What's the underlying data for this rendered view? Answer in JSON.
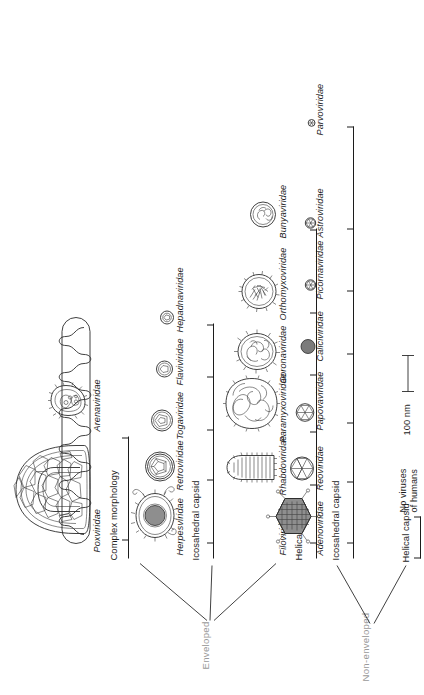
{
  "figure": {
    "scale_bar": {
      "label": "100 nm",
      "length_px": 37
    },
    "branches": {
      "enveloped": {
        "root_label": "Enveloped",
        "groups": [
          {
            "label": "Helical capsid",
            "families": [
              {
                "name": "Filoviridae",
                "shape": "filament"
              },
              {
                "name": "Rhabdoviridae",
                "shape": "bullet"
              },
              {
                "name": "Paramyxoviridae",
                "shape": "pleomorphic-large"
              },
              {
                "name": "Coronaviridae",
                "shape": "spiked-oval"
              },
              {
                "name": "Orthomyxoviridae",
                "shape": "spiked-round"
              },
              {
                "name": "Bunyaviridae",
                "shape": "small-round"
              }
            ]
          },
          {
            "label": "Icosahedral capsid",
            "families": [
              {
                "name": "Herpesviridae",
                "shape": "herpes"
              },
              {
                "name": "Retroviridae",
                "shape": "retro"
              },
              {
                "name": "Togaviridae",
                "shape": "toga"
              },
              {
                "name": "Flaviviridae",
                "shape": "flavi"
              },
              {
                "name": "Hepadnaviridae",
                "shape": "hepadna"
              }
            ]
          },
          {
            "label": "Complex morphology",
            "families": [
              {
                "name": "Poxviridae",
                "shape": "pox"
              },
              {
                "name": "Arenaviridae",
                "shape": "arena"
              }
            ]
          }
        ]
      },
      "non_enveloped": {
        "root_label": "Non-enveloped",
        "groups": [
          {
            "label": "Helical capsid",
            "note": "No viruses\nof humans",
            "note_line1": "No viruses",
            "note_line2": "of humans",
            "families": []
          },
          {
            "label": "Icosahedral capsid",
            "families": [
              {
                "name": "Adenoviridae",
                "shape": "adeno"
              },
              {
                "name": "Reoviridae",
                "shape": "reo"
              },
              {
                "name": "Papovaviridae",
                "shape": "papova"
              },
              {
                "name": "Caliciviridae",
                "shape": "calici"
              },
              {
                "name": "Picornaviridae",
                "shape": "picorna"
              },
              {
                "name": "Astroviridae",
                "shape": "astro"
              },
              {
                "name": "Parvoviridae",
                "shape": "parvo"
              }
            ]
          }
        ]
      }
    },
    "colors": {
      "ink": "#1c1c1c",
      "root_text": "#9a9a9a",
      "particle_stroke": "#2b2b2b",
      "particle_fill": "#8e8e8e"
    }
  }
}
